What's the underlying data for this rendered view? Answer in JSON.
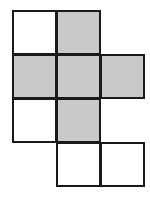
{
  "diagram": {
    "type": "cube-net",
    "grid": {
      "origin_x": 12,
      "origin_y": 10,
      "cell_size": 45
    },
    "colors": {
      "shaded": "#c9c9c9",
      "unshaded": "#ffffff",
      "border": "#1a1a1a"
    },
    "cells": [
      {
        "row": 0,
        "col": 0,
        "shaded": false
      },
      {
        "row": 0,
        "col": 1,
        "shaded": true
      },
      {
        "row": 1,
        "col": 0,
        "shaded": true
      },
      {
        "row": 1,
        "col": 1,
        "shaded": true
      },
      {
        "row": 1,
        "col": 2,
        "shaded": true
      },
      {
        "row": 2,
        "col": 0,
        "shaded": false
      },
      {
        "row": 2,
        "col": 1,
        "shaded": true
      },
      {
        "row": 3,
        "col": 1,
        "shaded": false
      },
      {
        "row": 3,
        "col": 2,
        "shaded": false
      }
    ]
  }
}
